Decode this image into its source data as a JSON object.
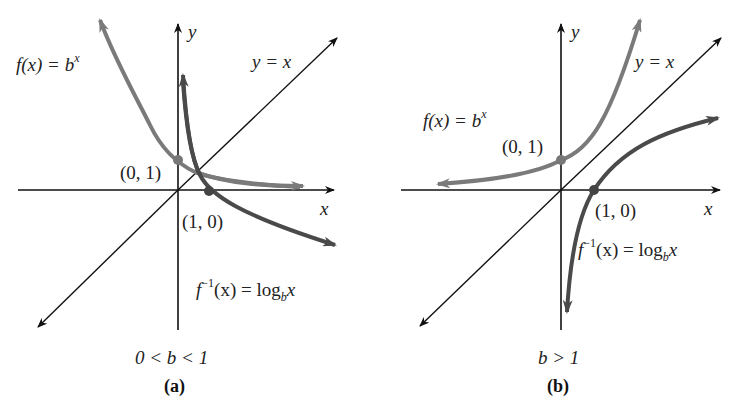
{
  "panels": [
    {
      "id": "a",
      "caption": "(a)",
      "condition": "0 < b < 1",
      "axis_x_label": "x",
      "axis_y_label": "y",
      "identity_label": "y = x",
      "exp_label_prefix": "f(x) = b",
      "exp_label_sup": "x",
      "log_label_f": "f",
      "log_label_sup": "−1",
      "log_label_mid": "(x) = log",
      "log_label_sub": "b",
      "log_label_end": "x",
      "point_exp": "(0, 1)",
      "point_log": "(1, 0)"
    },
    {
      "id": "b",
      "caption": "(b)",
      "condition": "b > 1",
      "axis_x_label": "x",
      "axis_y_label": "y",
      "identity_label": "y = x",
      "exp_label_prefix": "f(x) = b",
      "exp_label_sup": "x",
      "log_label_f": "f",
      "log_label_sup": "−1",
      "log_label_mid": "(x) = log",
      "log_label_sub": "b",
      "log_label_end": "x",
      "point_exp": "(0, 1)",
      "point_log": "(1, 0)"
    }
  ],
  "colors": {
    "axes": "#111111",
    "exp_curve": "#7a7a7a",
    "log_curve": "#4a4a4a",
    "points": "#555555"
  }
}
